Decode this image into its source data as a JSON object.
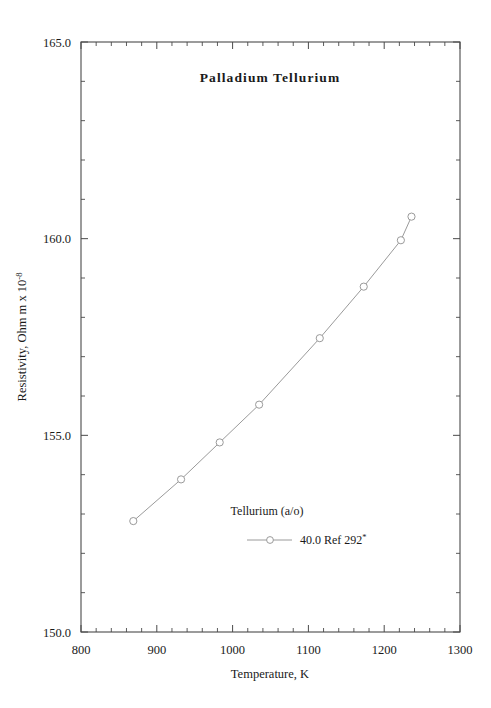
{
  "chart_data": {
    "type": "line",
    "title": "Palladium  Tellurium",
    "xlabel": "Temperature,  K",
    "ylabel_parts": {
      "main": "Resistivity, Ohm m x 10",
      "exponent": "-8"
    },
    "xlim": [
      800,
      1300
    ],
    "ylim": [
      150.0,
      165.0
    ],
    "xticks": [
      800,
      900,
      1000,
      1100,
      1200,
      1300
    ],
    "xtick_labels": [
      "800",
      "900",
      "1000",
      "1100",
      "1200",
      "1300"
    ],
    "yticks": [
      150.0,
      155.0,
      160.0,
      165.0
    ],
    "ytick_labels": [
      "150.0",
      "155.0",
      "160.0",
      "165.0"
    ],
    "x_minor_step": 20,
    "y_minor_step": 1.0,
    "grid": false,
    "legend_position": "inside-lower-center",
    "series": [
      {
        "name": "40.0 Ref 292",
        "marker": "open-circle",
        "line_color": "#9a9a9a",
        "marker_color": "#9a9a9a",
        "x": [
          869,
          932,
          983,
          1035,
          1115,
          1173,
          1222,
          1236
        ],
        "y": [
          152.82,
          153.88,
          154.82,
          155.78,
          157.47,
          158.78,
          159.96,
          160.56
        ]
      }
    ],
    "legend": {
      "header": "Tellurium (a/o)",
      "entries": [
        {
          "label": "40.0 Ref 292",
          "superscript": "*",
          "marker": "open-circle",
          "color": "#9a9a9a"
        }
      ]
    },
    "colors": {
      "axis": "#4a4a4a",
      "text": "#1a1a1a",
      "series": "#9a9a9a",
      "background": "#ffffff"
    }
  }
}
